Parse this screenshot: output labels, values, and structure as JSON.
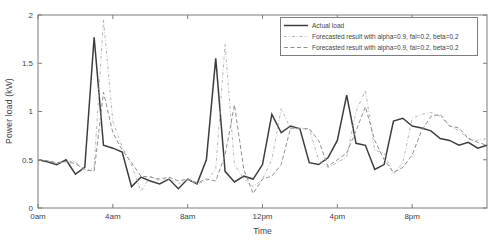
{
  "figure": {
    "background": "#ffffff",
    "axis_color": "#7d7d7d",
    "text_color": "#3f3f3f"
  },
  "chart_data": {
    "type": "line",
    "title": "",
    "xlabel": "Time",
    "ylabel": "Power load (kW)",
    "xlim": [
      0,
      24
    ],
    "ylim": [
      0,
      2
    ],
    "grid": false,
    "legend_position": "top-right",
    "x_unit": "hours",
    "x_step_hours": 0.5,
    "x_ticks": [
      {
        "hour": 0,
        "label": "0am"
      },
      {
        "hour": 4,
        "label": "4am"
      },
      {
        "hour": 8,
        "label": "8am"
      },
      {
        "hour": 12,
        "label": "12pm"
      },
      {
        "hour": 16,
        "label": "4pm"
      },
      {
        "hour": 20,
        "label": "8pm"
      }
    ],
    "y_ticks": [
      {
        "value": 0,
        "label": "0"
      },
      {
        "value": 0.5,
        "label": "0.5"
      },
      {
        "value": 1,
        "label": "1"
      },
      {
        "value": 1.5,
        "label": "1.5"
      },
      {
        "value": 2,
        "label": "2"
      }
    ],
    "series": [
      {
        "name": "Actual load",
        "style": "solid",
        "color": "#3d3d3d",
        "width": 1.5,
        "values": [
          0.5,
          0.48,
          0.45,
          0.5,
          0.35,
          0.42,
          1.77,
          0.65,
          0.62,
          0.58,
          0.22,
          0.32,
          0.28,
          0.25,
          0.3,
          0.2,
          0.3,
          0.25,
          0.5,
          1.55,
          0.38,
          0.27,
          0.33,
          0.3,
          0.45,
          0.97,
          0.78,
          0.85,
          0.82,
          0.47,
          0.45,
          0.52,
          0.7,
          1.17,
          0.67,
          0.65,
          0.4,
          0.45,
          0.9,
          0.93,
          0.85,
          0.83,
          0.8,
          0.72,
          0.7,
          0.65,
          0.68,
          0.62,
          0.65
        ]
      },
      {
        "name": "Forecasted result with alpha=0.9, fai=0.2, beta=0.2",
        "style": "dashdot",
        "color": "#b7b7b7",
        "width": 1,
        "values": [
          0.5,
          0.49,
          0.46,
          0.48,
          0.48,
          0.37,
          0.42,
          1.95,
          0.9,
          0.63,
          0.45,
          0.17,
          0.33,
          0.28,
          0.3,
          0.25,
          0.3,
          0.25,
          0.28,
          0.4,
          1.7,
          0.45,
          0.3,
          0.22,
          0.3,
          0.5,
          1.03,
          0.82,
          0.83,
          0.82,
          0.5,
          0.42,
          0.47,
          0.53,
          1.0,
          1.22,
          0.6,
          0.57,
          0.35,
          0.47,
          0.93,
          0.97,
          0.99,
          0.95,
          0.85,
          0.8,
          0.72,
          0.7,
          0.72
        ]
      },
      {
        "name": "Forecasted result with alpha=0.9, fai=0.2, beta=0.2",
        "style": "dashed",
        "color": "#8f8f8f",
        "width": 1,
        "values": [
          0.5,
          0.49,
          0.47,
          0.48,
          0.46,
          0.4,
          0.38,
          1.2,
          0.78,
          0.6,
          0.47,
          0.33,
          0.32,
          0.3,
          0.32,
          0.28,
          0.3,
          0.26,
          0.3,
          0.28,
          0.55,
          1.07,
          0.4,
          0.15,
          0.3,
          0.33,
          0.45,
          0.83,
          0.82,
          0.82,
          0.7,
          0.43,
          0.5,
          0.57,
          0.8,
          1.05,
          0.7,
          0.5,
          0.37,
          0.42,
          0.55,
          0.8,
          0.95,
          0.97,
          0.85,
          0.83,
          0.72,
          0.68,
          0.65
        ]
      }
    ]
  }
}
